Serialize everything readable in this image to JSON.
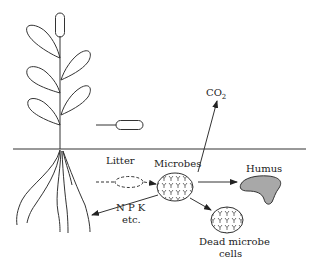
{
  "diagram": {
    "type": "soil nutrient cycle",
    "labels": {
      "co2": "CO",
      "co2_subscript": "2",
      "litter": "Litter",
      "microbes": "Microbes",
      "humus": "Humus",
      "npk": "N P K",
      "etc": "etc.",
      "dead_microbe_line1": "Dead microbe",
      "dead_microbe_line2": "cells"
    },
    "colors": {
      "line": "#333333",
      "humus_fill": "#a8a8a8",
      "background": "#ffffff"
    },
    "arrows": [
      {
        "from": "litter",
        "to": "microbes"
      },
      {
        "from": "microbes",
        "to": "co2"
      },
      {
        "from": "microbes",
        "to": "humus"
      },
      {
        "from": "microbes",
        "to": "dead-microbe-cells"
      },
      {
        "from": "microbes",
        "to": "plant-roots",
        "label": "N P K etc."
      }
    ]
  }
}
